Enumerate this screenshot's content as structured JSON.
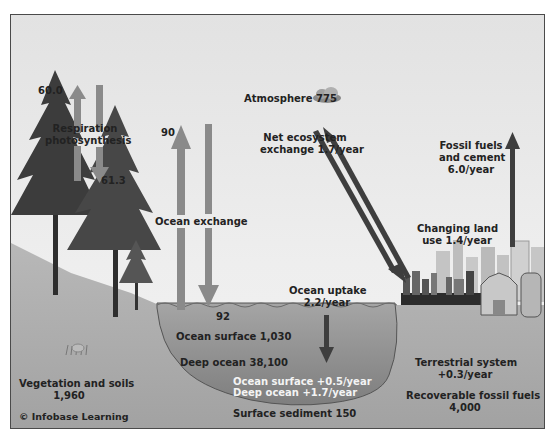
{
  "diagram": {
    "credit": "© Infobase Learning",
    "colors": {
      "sky": "#e8e8e8",
      "land": "#a9a9a9",
      "ocean": "#8e8e8e",
      "flux_arrow_gray": "#8a8a8a",
      "flux_arrow_dark": "#3e3e3e",
      "text": "#222222",
      "text_on_ocean": "#f4f4f4"
    },
    "reservoirs": {
      "atmosphere": "Atmosphere 775",
      "vegetation_soils_label": "Vegetation and soils",
      "vegetation_soils_value": "1,960",
      "ocean_surface": "Ocean surface 1,030",
      "deep_ocean": "Deep ocean 38,100",
      "surface_sediment": "Surface sediment 150",
      "recoverable_fossil_label": "Recoverable fossil fuels",
      "recoverable_fossil_value": "4,000"
    },
    "fluxes": {
      "respiration_up": "60.0",
      "photosynthesis_down": "61.3",
      "resp_photo_label_1": "Respiration",
      "resp_photo_label_2": "photosynthesis",
      "ocean_exchange_up": "90",
      "ocean_exchange_down": "92",
      "ocean_exchange_label": "Ocean exchange",
      "net_ecosystem_1": "Net ecosystem",
      "net_ecosystem_2": "exchange 1.7/year",
      "fossil_fuels_1": "Fossil fuels",
      "fossil_fuels_2": "and cement",
      "fossil_fuels_3": "6.0/year",
      "land_use_1": "Changing land",
      "land_use_2": "use 1.4/year",
      "ocean_uptake_1": "Ocean uptake",
      "ocean_uptake_2": "2.2/year"
    },
    "net_changes": {
      "ocean_surface_change": "Ocean surface +0.5/year",
      "deep_ocean_change": "Deep ocean +1.7/year",
      "terrestrial_1": "Terrestrial system",
      "terrestrial_2": "+0.3/year"
    }
  }
}
